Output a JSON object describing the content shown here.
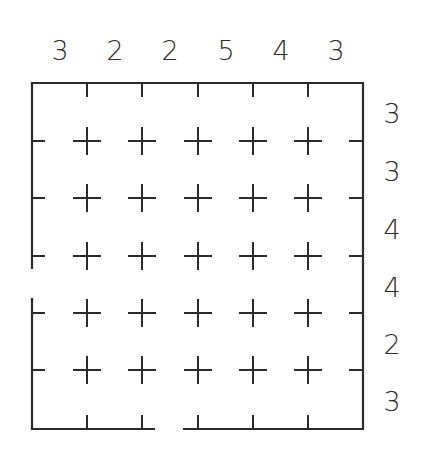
{
  "puzzle": {
    "type": "grid-clue-puzzle",
    "rows": 6,
    "cols": 6,
    "top_clues": [
      "3",
      "2",
      "2",
      "5",
      "4",
      "3"
    ],
    "right_clues": [
      "3",
      "3",
      "4",
      "4",
      "2",
      "3"
    ],
    "interior_marks": "plus",
    "border_gaps": [
      {
        "side": "left",
        "between_rows": [
          4,
          5
        ]
      },
      {
        "side": "bottom",
        "column": 3
      }
    ],
    "colors": {
      "line": "#2b2b2b",
      "text": "#2e2e2e",
      "background": "#ffffff"
    }
  }
}
